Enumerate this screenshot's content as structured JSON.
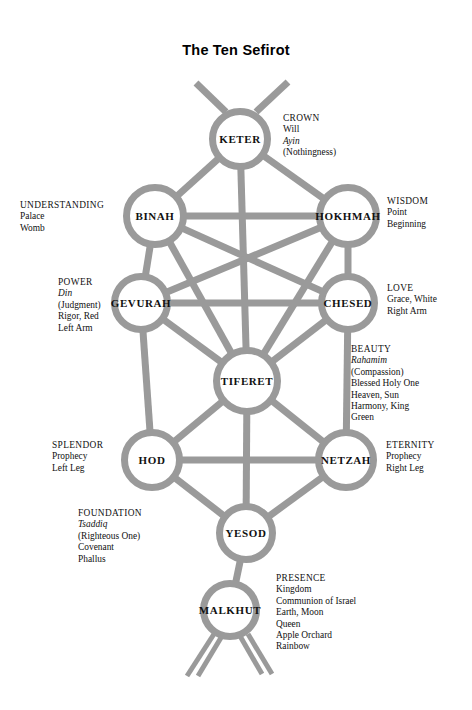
{
  "page": {
    "title": "The Ten Sefirot",
    "background_color": "#ffffff",
    "path_color": "#9a9a9a",
    "node_fill": "#ffffff",
    "text_color": "#111111"
  },
  "diagram": {
    "type": "kabbalistic-tree-of-life",
    "nodes": [
      {
        "id": "keter",
        "label": "KETER",
        "x": 240,
        "y": 139,
        "r": 31
      },
      {
        "id": "binah",
        "label": "BINAH",
        "x": 155,
        "y": 216,
        "r": 32
      },
      {
        "id": "hokhmah",
        "label": "HOKHMAH",
        "x": 348,
        "y": 216,
        "r": 32
      },
      {
        "id": "gevurah",
        "label": "GEVURAH",
        "x": 141,
        "y": 303,
        "r": 30
      },
      {
        "id": "chesed",
        "label": "CHESED",
        "x": 348,
        "y": 303,
        "r": 30
      },
      {
        "id": "tiferet",
        "label": "TIFERET",
        "x": 247,
        "y": 381,
        "r": 34
      },
      {
        "id": "hod",
        "label": "HOD",
        "x": 152,
        "y": 460,
        "r": 31
      },
      {
        "id": "netzah",
        "label": "NETZAH",
        "x": 346,
        "y": 460,
        "r": 31
      },
      {
        "id": "yesod",
        "label": "YESOD",
        "x": 246,
        "y": 533,
        "r": 30
      },
      {
        "id": "malkhut",
        "label": "MALKHUT",
        "x": 230,
        "y": 610,
        "r": 30
      }
    ],
    "glosses": [
      {
        "id": "crown",
        "for": "keter",
        "side": "right",
        "x": 283,
        "y": 113,
        "lines": [
          {
            "text": "CROWN",
            "style": "head"
          },
          {
            "text": "Will",
            "style": "plain"
          },
          {
            "text": "Ayin",
            "style": "italic"
          },
          {
            "text": "(Nothingness)",
            "style": "plain"
          }
        ]
      },
      {
        "id": "understanding",
        "for": "binah",
        "side": "left",
        "x": 20,
        "y": 200,
        "lines": [
          {
            "text": "UNDERSTANDING",
            "style": "head"
          },
          {
            "text": "Palace",
            "style": "plain"
          },
          {
            "text": "Womb",
            "style": "plain"
          }
        ]
      },
      {
        "id": "wisdom",
        "for": "hokhmah",
        "side": "right",
        "x": 387,
        "y": 196,
        "lines": [
          {
            "text": "WISDOM",
            "style": "head"
          },
          {
            "text": "Point",
            "style": "plain"
          },
          {
            "text": "Beginning",
            "style": "plain"
          }
        ]
      },
      {
        "id": "power",
        "for": "gevurah",
        "side": "left",
        "x": 58,
        "y": 277,
        "lines": [
          {
            "text": "POWER",
            "style": "head"
          },
          {
            "text": "Din",
            "style": "italic"
          },
          {
            "text": "(Judgment)",
            "style": "plain"
          },
          {
            "text": "Rigor, Red",
            "style": "plain"
          },
          {
            "text": "Left Arm",
            "style": "plain"
          }
        ]
      },
      {
        "id": "love",
        "for": "chesed",
        "side": "right",
        "x": 387,
        "y": 283,
        "lines": [
          {
            "text": "LOVE",
            "style": "head"
          },
          {
            "text": "Grace, White",
            "style": "plain"
          },
          {
            "text": "Right Arm",
            "style": "plain"
          }
        ]
      },
      {
        "id": "beauty",
        "for": "tiferet",
        "side": "right",
        "x": 351,
        "y": 344,
        "lines": [
          {
            "text": "BEAUTY",
            "style": "head"
          },
          {
            "text": "Rahamim",
            "style": "italic"
          },
          {
            "text": "(Compassion)",
            "style": "plain"
          },
          {
            "text": "Blessed Holy One",
            "style": "plain"
          },
          {
            "text": "Heaven, Sun",
            "style": "plain"
          },
          {
            "text": "Harmony, King",
            "style": "plain"
          },
          {
            "text": "Green",
            "style": "plain"
          }
        ]
      },
      {
        "id": "splendor",
        "for": "hod",
        "side": "left",
        "x": 52,
        "y": 440,
        "lines": [
          {
            "text": "SPLENDOR",
            "style": "head"
          },
          {
            "text": "Prophecy",
            "style": "plain"
          },
          {
            "text": "Left Leg",
            "style": "plain"
          }
        ]
      },
      {
        "id": "eternity",
        "for": "netzah",
        "side": "right",
        "x": 386,
        "y": 440,
        "lines": [
          {
            "text": "ETERNITY",
            "style": "head"
          },
          {
            "text": "Prophecy",
            "style": "plain"
          },
          {
            "text": "Right Leg",
            "style": "plain"
          }
        ]
      },
      {
        "id": "foundation",
        "for": "yesod",
        "side": "left",
        "x": 78,
        "y": 508,
        "lines": [
          {
            "text": "FOUNDATION",
            "style": "head"
          },
          {
            "text": "Tsaddiq",
            "style": "italic"
          },
          {
            "text": "(Righteous One)",
            "style": "plain"
          },
          {
            "text": "Covenant",
            "style": "plain"
          },
          {
            "text": "Phallus",
            "style": "plain"
          }
        ]
      },
      {
        "id": "presence",
        "for": "malkhut",
        "side": "right",
        "x": 276,
        "y": 573,
        "lines": [
          {
            "text": "PRESENCE",
            "style": "head"
          },
          {
            "text": "Kingdom",
            "style": "plain"
          },
          {
            "text": "Communion of Israel",
            "style": "plain"
          },
          {
            "text": "Earth, Moon",
            "style": "plain"
          },
          {
            "text": "Queen",
            "style": "plain"
          },
          {
            "text": "Apple Orchard",
            "style": "plain"
          },
          {
            "text": "Rainbow",
            "style": "plain"
          }
        ]
      }
    ],
    "paths": [
      {
        "id": "keter-binah",
        "from": "keter",
        "to": "binah"
      },
      {
        "id": "keter-hokhmah",
        "from": "keter",
        "to": "hokhmah"
      },
      {
        "id": "keter-tiferet",
        "from": "keter",
        "to": "tiferet"
      },
      {
        "id": "binah-hokhmah",
        "from": "binah",
        "to": "hokhmah"
      },
      {
        "id": "binah-gevurah",
        "from": "binah",
        "to": "gevurah"
      },
      {
        "id": "binah-tiferet",
        "from": "binah",
        "to": "tiferet"
      },
      {
        "id": "binah-chesed",
        "from": "binah",
        "to": "chesed"
      },
      {
        "id": "hokhmah-chesed",
        "from": "hokhmah",
        "to": "chesed"
      },
      {
        "id": "hokhmah-tiferet",
        "from": "hokhmah",
        "to": "tiferet"
      },
      {
        "id": "hokhmah-gevurah",
        "from": "hokhmah",
        "to": "gevurah"
      },
      {
        "id": "gevurah-chesed",
        "from": "gevurah",
        "to": "chesed"
      },
      {
        "id": "gevurah-tiferet",
        "from": "gevurah",
        "to": "tiferet"
      },
      {
        "id": "gevurah-hod",
        "from": "gevurah",
        "to": "hod"
      },
      {
        "id": "chesed-tiferet",
        "from": "chesed",
        "to": "tiferet"
      },
      {
        "id": "chesed-netzah",
        "from": "chesed",
        "to": "netzah"
      },
      {
        "id": "tiferet-hod",
        "from": "tiferet",
        "to": "hod"
      },
      {
        "id": "tiferet-netzah",
        "from": "tiferet",
        "to": "netzah"
      },
      {
        "id": "tiferet-yesod",
        "from": "tiferet",
        "to": "yesod"
      },
      {
        "id": "hod-netzah",
        "from": "hod",
        "to": "netzah"
      },
      {
        "id": "hod-yesod",
        "from": "hod",
        "to": "yesod"
      },
      {
        "id": "netzah-yesod",
        "from": "netzah",
        "to": "yesod"
      },
      {
        "id": "yesod-malkhut",
        "from": "yesod",
        "to": "malkhut"
      }
    ],
    "branches": [
      {
        "id": "crown-branch-left",
        "d": "M 226 112 L 196 83"
      },
      {
        "id": "crown-branch-right",
        "d": "M 256 112 L 288 82"
      }
    ],
    "roots": [
      {
        "id": "root-left",
        "d": "M 214 634 L 187 676"
      },
      {
        "id": "root-right",
        "d": "M 248 634 L 272 674"
      },
      {
        "id": "root-left-inner",
        "d": "M 222 636 L 198 676"
      },
      {
        "id": "root-right-inner",
        "d": "M 240 636 L 262 674"
      }
    ]
  }
}
